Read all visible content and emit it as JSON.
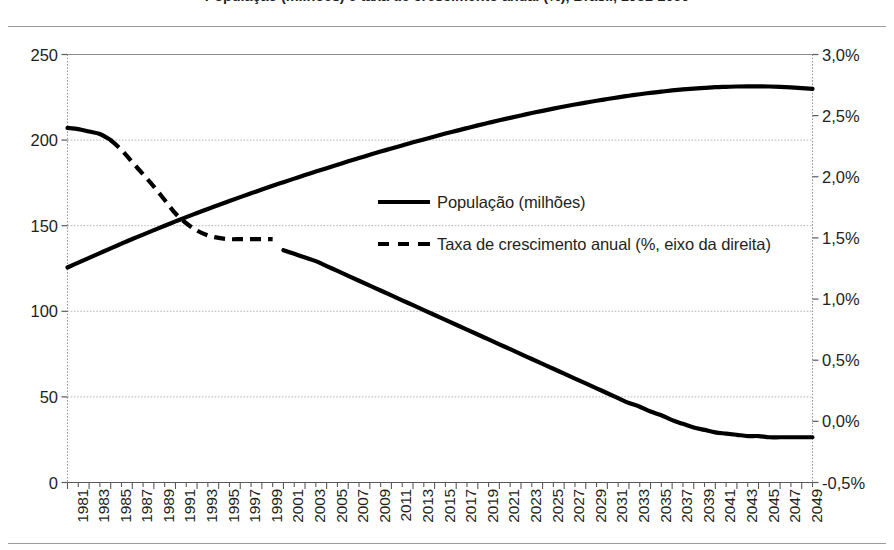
{
  "chart_data": {
    "type": "line",
    "title": "População (milhões) e taxa de crescimento anual (%), Brasil, 1981-2050",
    "xlabel": "",
    "ylabel": "",
    "grid": true,
    "legend_position": "center",
    "x_axis": {
      "tick_labels": [
        "1981",
        "1983",
        "1985",
        "1987",
        "1989",
        "1991",
        "1993",
        "1995",
        "1997",
        "1999",
        "2001",
        "2003",
        "2005",
        "2007",
        "2009",
        "2011",
        "2013",
        "2015",
        "2017",
        "2019",
        "2021",
        "2023",
        "2025",
        "2027",
        "2029",
        "2031",
        "2033",
        "2035",
        "2037",
        "2039",
        "2041",
        "2043",
        "2045",
        "2047",
        "2049"
      ],
      "minor_tick_years": [
        "1982",
        "1984",
        "1986",
        "1988",
        "1990",
        "1992",
        "1994",
        "1996",
        "1998",
        "2000",
        "2002",
        "2004",
        "2006",
        "2008",
        "2010",
        "2012",
        "2014",
        "2016",
        "2018",
        "2020",
        "2022",
        "2024",
        "2026",
        "2028",
        "2030",
        "2032",
        "2034",
        "2036",
        "2038",
        "2040",
        "2042",
        "2044",
        "2046",
        "2048",
        "2050"
      ],
      "range": [
        1981,
        2050
      ]
    },
    "y_axis_left": {
      "tick_labels": [
        "0",
        "50",
        "100",
        "150",
        "200",
        "250"
      ],
      "tick_values": [
        0,
        50,
        100,
        150,
        200,
        250
      ],
      "ylim": [
        0,
        250
      ],
      "unit": "milhões"
    },
    "y_axis_right": {
      "tick_labels": [
        "-0,5%",
        "0,0%",
        "0,5%",
        "1,0%",
        "1,5%",
        "2,0%",
        "2,5%",
        "3,0%"
      ],
      "tick_values": [
        -0.5,
        0.0,
        0.5,
        1.0,
        1.5,
        2.0,
        2.5,
        3.0
      ],
      "ylim": [
        -0.5,
        3.0
      ],
      "unit": "%"
    },
    "series": [
      {
        "name": "População (milhões)",
        "axis": "left",
        "style": "solid",
        "color": "#000000",
        "x": [
          1981,
          1982,
          1983,
          1984,
          1985,
          1986,
          1987,
          1988,
          1989,
          1990,
          1991,
          1992,
          1993,
          1994,
          1995,
          1996,
          1997,
          1998,
          1999,
          2000,
          2001,
          2002,
          2003,
          2004,
          2005,
          2006,
          2007,
          2008,
          2009,
          2010,
          2011,
          2012,
          2013,
          2014,
          2015,
          2016,
          2017,
          2018,
          2019,
          2020,
          2021,
          2022,
          2023,
          2024,
          2025,
          2026,
          2027,
          2028,
          2029,
          2030,
          2031,
          2032,
          2033,
          2034,
          2035,
          2036,
          2037,
          2038,
          2039,
          2040,
          2041,
          2042,
          2043,
          2044,
          2045,
          2046,
          2047,
          2048,
          2049,
          2050
        ],
        "values": [
          125.6,
          128.4,
          131.2,
          134.0,
          136.8,
          139.5,
          142.2,
          144.8,
          147.4,
          150.0,
          152.5,
          155.0,
          157.4,
          159.8,
          162.1,
          164.4,
          166.7,
          168.9,
          171.1,
          173.3,
          175.4,
          177.5,
          179.6,
          181.6,
          183.6,
          185.6,
          187.6,
          189.5,
          191.4,
          193.3,
          195.1,
          196.9,
          198.7,
          200.4,
          202.1,
          203.8,
          205.4,
          207.0,
          208.6,
          210.1,
          211.6,
          213.0,
          214.4,
          215.8,
          217.1,
          218.4,
          219.6,
          220.8,
          221.9,
          223.0,
          224.0,
          225.0,
          225.9,
          226.8,
          227.6,
          228.3,
          229.0,
          229.6,
          230.1,
          230.5,
          230.9,
          231.1,
          231.3,
          231.4,
          231.4,
          231.3,
          231.1,
          230.8,
          230.4,
          229.9
        ]
      },
      {
        "name": "Taxa de crescimento anual (%, eixo da direita)",
        "axis": "right",
        "style": "dashed",
        "color": "#000000",
        "x": [
          1981,
          1982,
          1983,
          1984,
          1985,
          1986,
          1987,
          1988,
          1989,
          1990,
          1991,
          1992,
          1993,
          1994,
          1995,
          1996,
          1997,
          1998,
          1999,
          2000,
          2001,
          2002,
          2003,
          2004,
          2005,
          2006,
          2007,
          2008,
          2009,
          2010,
          2011,
          2012,
          2013,
          2014,
          2015,
          2016,
          2017,
          2018,
          2019,
          2020,
          2021,
          2022,
          2023,
          2024,
          2025,
          2026,
          2027,
          2028,
          2029,
          2030,
          2031,
          2032,
          2033,
          2034,
          2035,
          2036,
          2037,
          2038,
          2039,
          2040,
          2041,
          2042,
          2043,
          2044,
          2045,
          2046,
          2047,
          2048,
          2049,
          2050
        ],
        "values": [
          2.4,
          2.39,
          2.37,
          2.35,
          2.3,
          2.22,
          2.12,
          2.02,
          1.92,
          1.81,
          1.7,
          1.62,
          1.56,
          1.52,
          1.5,
          1.49,
          1.49,
          1.49,
          1.49,
          1.49,
          1.4,
          1.37,
          1.34,
          1.31,
          1.27,
          1.23,
          1.19,
          1.15,
          1.11,
          1.07,
          1.03,
          0.99,
          0.95,
          0.91,
          0.87,
          0.83,
          0.79,
          0.75,
          0.71,
          0.67,
          0.63,
          0.59,
          0.55,
          0.51,
          0.47,
          0.43,
          0.39,
          0.35,
          0.31,
          0.27,
          0.23,
          0.19,
          0.15,
          0.12,
          0.08,
          0.05,
          0.01,
          -0.02,
          -0.05,
          -0.07,
          -0.09,
          -0.1,
          -0.11,
          -0.12,
          -0.12,
          -0.13,
          -0.13,
          -0.13,
          -0.13,
          -0.13
        ]
      }
    ]
  },
  "legend": {
    "items": [
      {
        "label": "População (milhões)",
        "style": "solid"
      },
      {
        "label": "Taxa de crescimento anual (%, eixo da direita)",
        "style": "dashed"
      }
    ]
  }
}
